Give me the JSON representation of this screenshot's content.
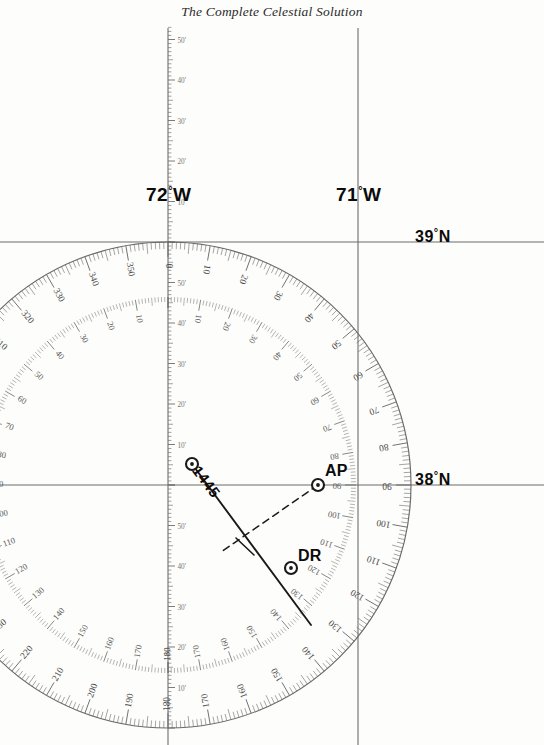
{
  "page": {
    "title": "The Complete Celestial Solution",
    "background_color": "#fdfdfb",
    "ink_color": "#1a1a1a",
    "grid_color": "#6d6d6d",
    "rose_color": "#6a6a6a"
  },
  "meridians": [
    {
      "name": "meridian-72w",
      "label": "72",
      "unit": "°",
      "hemisphere": "W",
      "x": 168
    },
    {
      "name": "meridian-71w",
      "label": "71",
      "unit": "°",
      "hemisphere": "W",
      "x": 358
    }
  ],
  "parallels": [
    {
      "name": "parallel-39n",
      "label": "39",
      "unit": "°",
      "hemisphere": "N",
      "y": 242
    },
    {
      "name": "parallel-38n",
      "label": "38",
      "unit": "°",
      "hemisphere": "N",
      "y": 485
    }
  ],
  "latitude_scale": {
    "name": "latitude-minute-scale",
    "minute_labels": [
      "50'",
      "40'",
      "30'",
      "20'",
      "10'"
    ],
    "description": "minute graduations along the 72°W meridian"
  },
  "compass_rose": {
    "center_x": 168,
    "center_y": 485,
    "radius": 243,
    "outer_ring_labels": [
      "0",
      "10",
      "20",
      "30",
      "40",
      "50",
      "60",
      "70",
      "80",
      "90",
      "100",
      "110",
      "120",
      "130",
      "140",
      "150",
      "160",
      "170",
      "180",
      "190",
      "200",
      "210",
      "220",
      "230",
      "240",
      "250",
      "260",
      "270",
      "280",
      "290",
      "300",
      "310",
      "320",
      "330",
      "340",
      "350"
    ],
    "inner_ring_labels": [
      "10",
      "20",
      "30",
      "40",
      "50",
      "60",
      "70",
      "80",
      "90",
      "100",
      "110",
      "120",
      "130",
      "140",
      "150",
      "160",
      "170",
      "180"
    ],
    "inner_ring_right_labels": [
      "10",
      "20",
      "30",
      "40",
      "50",
      "60",
      "70",
      "80",
      "90",
      "100",
      "110",
      "120",
      "130"
    ],
    "inner_ring_left_labels": [
      "50",
      "60",
      "70"
    ],
    "tick_interval_degrees": 1,
    "label_interval_degrees": 10
  },
  "plot": {
    "assumed_position": {
      "name": "assumed-position",
      "label": "AP",
      "x": 318,
      "y": 485
    },
    "dead_reckoning": {
      "name": "dead-reckoning-position",
      "label": "DR",
      "x": 291,
      "y": 568
    },
    "fix_point": {
      "name": "fix-point",
      "label": "",
      "x": 192,
      "y": 464
    },
    "line_of_position": {
      "name": "line-of-position",
      "time_label": "1445",
      "x1": 192,
      "y1": 464,
      "x2": 311,
      "y2": 625,
      "rotation_degrees": 53
    },
    "azimuth_line": {
      "name": "azimuth-intercept-line",
      "style": "dashed",
      "x1": 318,
      "y1": 485,
      "x2": 221,
      "y2": 552
    },
    "intercept_tick": {
      "name": "intercept-tick-mark",
      "x1": 236,
      "y1": 538,
      "x2": 254,
      "y2": 555
    }
  }
}
